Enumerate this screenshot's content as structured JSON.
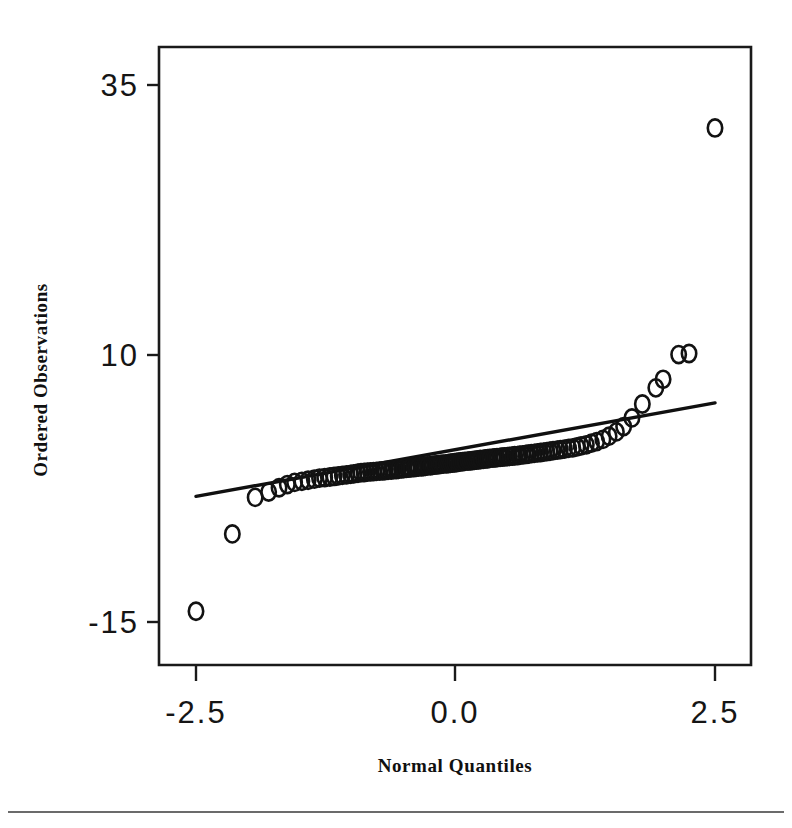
{
  "figure": {
    "name": "normal-qq-plot",
    "background": "#ffffff",
    "ink_color": "#121212"
  },
  "chart_data": {
    "type": "scatter",
    "title": "",
    "subtitle": "",
    "xlabel": "Normal Quantiles",
    "ylabel": "Ordered Observations",
    "xlim": [
      -3.05,
      3.05
    ],
    "ylim": [
      -21.5,
      41.0
    ],
    "xticks": [
      -2.5,
      0.0,
      2.5
    ],
    "xticklabels": [
      "-2.5",
      "0.0",
      "2.5"
    ],
    "yticks": [
      35,
      10,
      -15
    ],
    "yticklabels": [
      "35",
      "10",
      "-15"
    ],
    "grid": false,
    "legend": false,
    "legend_position": "none",
    "marker": "open-circle",
    "annotations": [],
    "reference_line": {
      "name": "normal-reference-line",
      "x": [
        -2.5,
        2.5
      ],
      "y": [
        -3.3,
        5.4
      ]
    },
    "series": [
      {
        "name": "Ordered Observations",
        "marker": "o",
        "x": [
          -2.5,
          -2.15,
          -1.93,
          -1.8,
          -1.7,
          -1.62,
          -1.55,
          -1.48,
          -1.42,
          -1.36,
          -1.31,
          -1.26,
          -1.21,
          -1.17,
          -1.13,
          -1.09,
          -1.05,
          -1.01,
          -0.98,
          -0.94,
          -0.91,
          -0.88,
          -0.85,
          -0.82,
          -0.79,
          -0.76,
          -0.73,
          -0.7,
          -0.68,
          -0.65,
          -0.62,
          -0.6,
          -0.57,
          -0.55,
          -0.52,
          -0.5,
          -0.47,
          -0.45,
          -0.43,
          -0.4,
          -0.38,
          -0.36,
          -0.33,
          -0.31,
          -0.29,
          -0.27,
          -0.24,
          -0.22,
          -0.2,
          -0.18,
          -0.16,
          -0.14,
          -0.12,
          -0.09,
          -0.07,
          -0.05,
          -0.03,
          -0.01,
          0.01,
          0.03,
          0.05,
          0.07,
          0.09,
          0.12,
          0.14,
          0.16,
          0.18,
          0.2,
          0.22,
          0.24,
          0.27,
          0.29,
          0.31,
          0.33,
          0.36,
          0.38,
          0.4,
          0.43,
          0.45,
          0.47,
          0.5,
          0.52,
          0.55,
          0.57,
          0.6,
          0.62,
          0.65,
          0.68,
          0.7,
          0.73,
          0.76,
          0.79,
          0.82,
          0.85,
          0.88,
          0.91,
          0.94,
          0.98,
          1.01,
          1.05,
          1.09,
          1.13,
          1.17,
          1.21,
          1.26,
          1.31,
          1.36,
          1.42,
          1.48,
          1.55,
          1.62,
          1.7,
          1.8,
          1.93,
          2.0,
          2.15,
          2.25,
          2.5
        ],
        "y": [
          -14.0,
          -6.8,
          -3.4,
          -2.9,
          -2.5,
          -2.2,
          -2.0,
          -1.9,
          -1.8,
          -1.7,
          -1.6,
          -1.55,
          -1.5,
          -1.45,
          -1.4,
          -1.35,
          -1.3,
          -1.25,
          -1.2,
          -1.15,
          -1.1,
          -1.08,
          -1.05,
          -1.02,
          -1.0,
          -0.97,
          -0.95,
          -0.92,
          -0.9,
          -0.87,
          -0.85,
          -0.82,
          -0.8,
          -0.78,
          -0.75,
          -0.72,
          -0.7,
          -0.68,
          -0.65,
          -0.62,
          -0.6,
          -0.57,
          -0.55,
          -0.52,
          -0.5,
          -0.47,
          -0.45,
          -0.42,
          -0.4,
          -0.37,
          -0.35,
          -0.32,
          -0.3,
          -0.27,
          -0.25,
          -0.22,
          -0.2,
          -0.17,
          -0.15,
          -0.12,
          -0.1,
          -0.07,
          -0.05,
          -0.02,
          0.0,
          0.03,
          0.05,
          0.08,
          0.1,
          0.13,
          0.15,
          0.18,
          0.2,
          0.23,
          0.25,
          0.28,
          0.3,
          0.33,
          0.35,
          0.38,
          0.4,
          0.43,
          0.45,
          0.48,
          0.5,
          0.53,
          0.56,
          0.6,
          0.63,
          0.67,
          0.7,
          0.74,
          0.78,
          0.82,
          0.86,
          0.9,
          0.95,
          1.0,
          1.05,
          1.1,
          1.16,
          1.22,
          1.3,
          1.4,
          1.5,
          1.65,
          1.8,
          2.0,
          2.3,
          2.7,
          3.2,
          4.0,
          5.3,
          6.8,
          7.6,
          9.9,
          10.0,
          31.0
        ]
      }
    ]
  }
}
